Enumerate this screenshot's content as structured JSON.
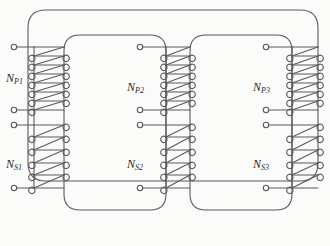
{
  "figure": {
    "kind": "three-limb-transformer-core-diagram",
    "background_color": "#fbfbfa",
    "line_color": "#5a5a5a",
    "text_color": "#2a2a2a",
    "width": 330,
    "height": 246
  },
  "labels": {
    "np1": {
      "base": "N",
      "sub": "P1"
    },
    "np2": {
      "base": "N",
      "sub": "P2"
    },
    "np3": {
      "base": "N",
      "sub": "P3"
    },
    "ns1": {
      "base": "N",
      "sub": "S1"
    },
    "ns2": {
      "base": "N",
      "sub": "S2"
    },
    "ns3": {
      "base": "N",
      "sub": "S3"
    }
  },
  "windings": [
    {
      "name": "N_P1",
      "limb": "left",
      "type": "primary",
      "turns": 7
    },
    {
      "name": "N_S1",
      "limb": "left",
      "type": "secondary",
      "turns": 5
    },
    {
      "name": "N_P2",
      "limb": "middle",
      "type": "primary",
      "turns": 7
    },
    {
      "name": "N_S2",
      "limb": "middle",
      "type": "secondary",
      "turns": 5
    },
    {
      "name": "N_P3",
      "limb": "right",
      "type": "primary",
      "turns": 7
    },
    {
      "name": "N_S3",
      "limb": "right",
      "type": "secondary",
      "turns": 5
    }
  ],
  "terminals": [
    {
      "winding": "N_P1",
      "position": "top"
    },
    {
      "winding": "N_P1",
      "position": "bottom"
    },
    {
      "winding": "N_S1",
      "position": "top"
    },
    {
      "winding": "N_S1",
      "position": "bottom"
    },
    {
      "winding": "N_P2",
      "position": "top"
    },
    {
      "winding": "N_P2",
      "position": "bottom"
    },
    {
      "winding": "N_S2",
      "position": "top"
    },
    {
      "winding": "N_S2",
      "position": "bottom"
    },
    {
      "winding": "N_P3",
      "position": "top"
    },
    {
      "winding": "N_P3",
      "position": "bottom"
    },
    {
      "winding": "N_S3",
      "position": "top"
    },
    {
      "winding": "N_S3",
      "position": "bottom"
    }
  ]
}
